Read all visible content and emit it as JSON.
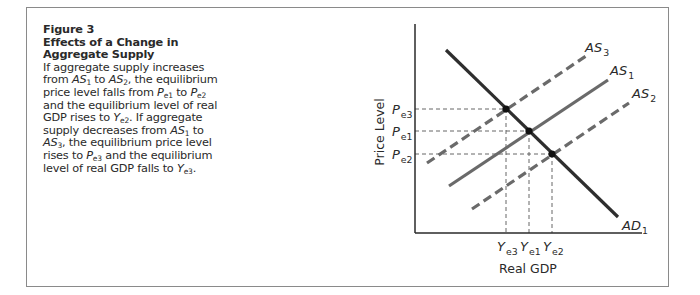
{
  "figure": {
    "number": "Figure 3",
    "title": "Effects of a Change in Aggregate Supply",
    "caption_segments": [
      {
        "t": "If aggregate supply increases from "
      },
      {
        "t": "AS",
        "i": true
      },
      {
        "sub": "1"
      },
      {
        "t": " to "
      },
      {
        "t": "AS",
        "i": true
      },
      {
        "sub": "2"
      },
      {
        "t": ", the equilibrium price level falls from "
      },
      {
        "t": "P",
        "i": true
      },
      {
        "sub": "e1"
      },
      {
        "t": " to "
      },
      {
        "t": "P",
        "i": true
      },
      {
        "sub": "e2"
      },
      {
        "t": " and the equilibrium level of real GDP rises to "
      },
      {
        "t": "Y",
        "i": true
      },
      {
        "sub": "e2"
      },
      {
        "t": ". If aggregate supply decreases from "
      },
      {
        "t": "AS",
        "i": true
      },
      {
        "sub": "1"
      },
      {
        "t": " to "
      },
      {
        "t": "AS",
        "i": true
      },
      {
        "sub": "3"
      },
      {
        "t": ", the equilibrium price level rises to "
      },
      {
        "t": "P",
        "i": true
      },
      {
        "sub": "e3"
      },
      {
        "t": " and the equilibrium level of real GDP falls to "
      },
      {
        "t": "Y",
        "i": true
      },
      {
        "sub": "e3"
      },
      {
        "t": "."
      }
    ]
  },
  "chart_data": {
    "type": "line",
    "title": "Effects of a Change in Aggregate Supply",
    "xlabel": "Real GDP",
    "ylabel": "Price Level",
    "grid": false,
    "legend": "inline labels at line ends",
    "x_ticks": [
      {
        "label": "Y",
        "sub": "e3",
        "x": 506
      },
      {
        "label": "Y",
        "sub": "e1",
        "x": 529
      },
      {
        "label": "Y",
        "sub": "e2",
        "x": 552
      }
    ],
    "y_ticks": [
      {
        "label": "P",
        "sub": "e3",
        "y": 109
      },
      {
        "label": "P",
        "sub": "e1",
        "y": 131
      },
      {
        "label": "P",
        "sub": "e2",
        "y": 154
      }
    ],
    "series": [
      {
        "name": "AD",
        "sub": "1",
        "style": "solid",
        "color": "#2e2e2e",
        "width": 3.2,
        "points": [
          [
            446,
            50
          ],
          [
            618,
            217
          ]
        ],
        "label_pos": [
          622,
          230
        ]
      },
      {
        "name": "AS",
        "sub": "3",
        "style": "dashed",
        "color": "#6a6a6a",
        "width": 3.2,
        "points": [
          [
            427,
            163
          ],
          [
            586,
            56
          ]
        ],
        "label_pos": [
          585,
          52
        ]
      },
      {
        "name": "AS",
        "sub": "1",
        "style": "solid",
        "color": "#6a6a6a",
        "width": 3.2,
        "points": [
          [
            449,
            186
          ],
          [
            608,
            80
          ]
        ],
        "label_pos": [
          610,
          75
        ]
      },
      {
        "name": "AS",
        "sub": "2",
        "style": "dashed",
        "color": "#6a6a6a",
        "width": 3.2,
        "points": [
          [
            472,
            209
          ],
          [
            629,
            103
          ]
        ],
        "label_pos": [
          632,
          98
        ]
      }
    ],
    "equilibria": [
      {
        "name": "E3",
        "x": 506,
        "y": 109,
        "curves": [
          "AD1",
          "AS3"
        ]
      },
      {
        "name": "E1",
        "x": 529,
        "y": 131,
        "curves": [
          "AD1",
          "AS1"
        ]
      },
      {
        "name": "E2",
        "x": 552,
        "y": 154,
        "curves": [
          "AD1",
          "AS2"
        ]
      }
    ],
    "axes": {
      "origin": [
        415,
        233
      ],
      "y_top": 24,
      "x_right": 642
    }
  }
}
